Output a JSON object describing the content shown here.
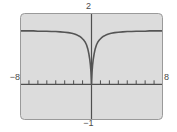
{
  "figure": {
    "kind": "graphing-calculator-plot-window",
    "background_color": "#ffffff",
    "plot_background_color": "#dcdcdc",
    "frame_border_color": "#9a9a9a",
    "axis_color": "#4f4f4f",
    "curve_color": "#555555",
    "label_color": "#4a4a4a"
  },
  "labels": {
    "y_max": "2",
    "y_min": "−1",
    "x_min": "−8",
    "x_max": "8"
  },
  "chart_data": {
    "type": "line",
    "title": "",
    "xlabel": "",
    "ylabel": "",
    "xlim": [
      -8,
      8
    ],
    "ylim": [
      -1,
      2
    ],
    "grid": false,
    "legend": "none",
    "axes": {
      "x_axis_at_y": 0,
      "y_axis_at_x": 0,
      "x_tick_spacing": 1,
      "x_tick_values": [
        -7,
        -6,
        -5,
        -4,
        -3,
        -2,
        -1,
        1,
        2,
        3,
        4,
        5,
        6,
        7
      ],
      "y_ticks_shown": false,
      "tick_mark_length_px": 4
    },
    "annotations": [
      "curve has a sharp cusp minimum touching y = 0 at x = 0",
      "curve is symmetric about the y-axis (even function)",
      "curve flattens to a horizontal asymptote near y = 1.5 as x → ±8"
    ],
    "series": [
      {
        "name": "f(x)",
        "x": [
          -8,
          -7.5,
          -7,
          -6.5,
          -6,
          -5.5,
          -5,
          -4.5,
          -4,
          -3.5,
          -3,
          -2.6,
          -2.2,
          -1.9,
          -1.6,
          -1.35,
          -1.1,
          -0.9,
          -0.72,
          -0.56,
          -0.42,
          -0.3,
          -0.2,
          -0.12,
          -0.06,
          -0.02,
          0,
          0.02,
          0.06,
          0.12,
          0.2,
          0.3,
          0.42,
          0.56,
          0.72,
          0.9,
          1.1,
          1.35,
          1.6,
          1.9,
          2.2,
          2.6,
          3,
          3.5,
          4,
          4.5,
          5,
          5.5,
          6,
          6.5,
          7,
          7.5,
          8
        ],
        "y": [
          1.5,
          1.5,
          1.5,
          1.5,
          1.49,
          1.49,
          1.49,
          1.48,
          1.48,
          1.47,
          1.46,
          1.45,
          1.43,
          1.41,
          1.38,
          1.35,
          1.3,
          1.25,
          1.19,
          1.11,
          1.0,
          0.86,
          0.71,
          0.54,
          0.35,
          0.14,
          0.0,
          0.14,
          0.35,
          0.54,
          0.71,
          0.86,
          1.0,
          1.11,
          1.19,
          1.25,
          1.3,
          1.35,
          1.38,
          1.41,
          1.43,
          1.45,
          1.46,
          1.47,
          1.48,
          1.48,
          1.49,
          1.49,
          1.49,
          1.5,
          1.5,
          1.5,
          1.5
        ]
      }
    ]
  }
}
